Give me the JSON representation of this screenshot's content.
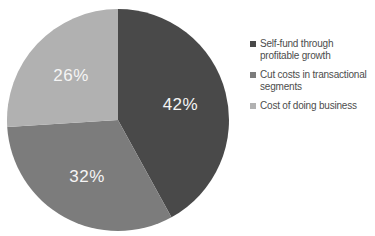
{
  "chart_data": {
    "type": "pie",
    "title": "",
    "start_angle_deg": 0,
    "direction": "clockwise",
    "legend_position": "right",
    "value_label_color": "#f5f5f5",
    "legend_text_color": "#4d4d4d",
    "slices": [
      {
        "label": "Self-fund through profitable growth",
        "label_lines": [
          "Self-fund through",
          "profitable growth"
        ],
        "value": 42,
        "display": "42%",
        "color": "#494949"
      },
      {
        "label": "Cut costs in transactional segments",
        "label_lines": [
          "Cut costs in transactional",
          "segments"
        ],
        "value": 32,
        "display": "32%",
        "color": "#7c7c7c"
      },
      {
        "label": "Cost of doing business",
        "label_lines": [
          "Cost of doing business"
        ],
        "value": 26,
        "display": "26%",
        "color": "#b1b1b1"
      }
    ]
  }
}
